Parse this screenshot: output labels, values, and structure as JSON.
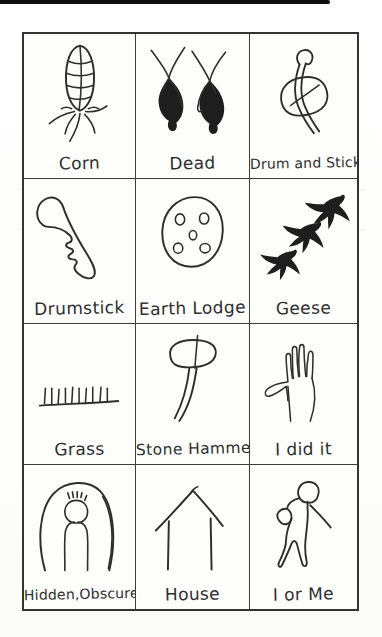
{
  "page": {
    "kind": "scanned pictograph chart page",
    "paper_color": "#fefefd",
    "ink_color": "#2e2e2e",
    "edge_bar_color": "#0d0d0d"
  },
  "grid": {
    "rows": 4,
    "cols": 3,
    "cells": [
      {
        "label": "Corn",
        "icon": "corn-pictograph"
      },
      {
        "label": "Dead",
        "icon": "dead-pictograph"
      },
      {
        "label": "Drum and Stick",
        "icon": "drum-and-stick-pictograph"
      },
      {
        "label": "Drumstick",
        "icon": "drumstick-pictograph"
      },
      {
        "label": "Earth Lodge",
        "icon": "earth-lodge-pictograph"
      },
      {
        "label": "Geese",
        "icon": "geese-pictograph"
      },
      {
        "label": "Grass",
        "icon": "grass-pictograph"
      },
      {
        "label": "Stone Hammer",
        "icon": "stone-hammer-pictograph"
      },
      {
        "label": "I did it",
        "icon": "i-did-it-pictograph"
      },
      {
        "label": "Hidden,Obscure",
        "icon": "hidden-obscure-pictograph"
      },
      {
        "label": "House",
        "icon": "house-pictograph"
      },
      {
        "label": "I or Me",
        "icon": "i-or-me-pictograph"
      }
    ]
  }
}
